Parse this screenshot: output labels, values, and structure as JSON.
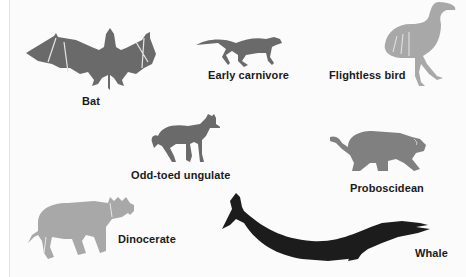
{
  "figure": {
    "colors": {
      "background": "#fbfbfb",
      "dark_gray": "#6a6a6a",
      "medium_gray": "#808080",
      "light_gray": "#a8a8a8",
      "black": "#1c1c1c",
      "label": "#1a1a1a"
    },
    "animals": [
      {
        "id": "bat",
        "label": "Bat",
        "tone": "dark_gray"
      },
      {
        "id": "early-carnivore",
        "label": "Early carnivore",
        "tone": "dark_gray"
      },
      {
        "id": "flightless-bird",
        "label": "Flightless bird",
        "tone": "light_gray"
      },
      {
        "id": "odd-toed-ungulate",
        "label": "Odd-toed ungulate",
        "tone": "dark_gray"
      },
      {
        "id": "proboscidean",
        "label": "Proboscidean",
        "tone": "dark_gray"
      },
      {
        "id": "dinocerate",
        "label": "Dinocerate",
        "tone": "light_gray"
      },
      {
        "id": "whale",
        "label": "Whale",
        "tone": "black"
      }
    ]
  }
}
